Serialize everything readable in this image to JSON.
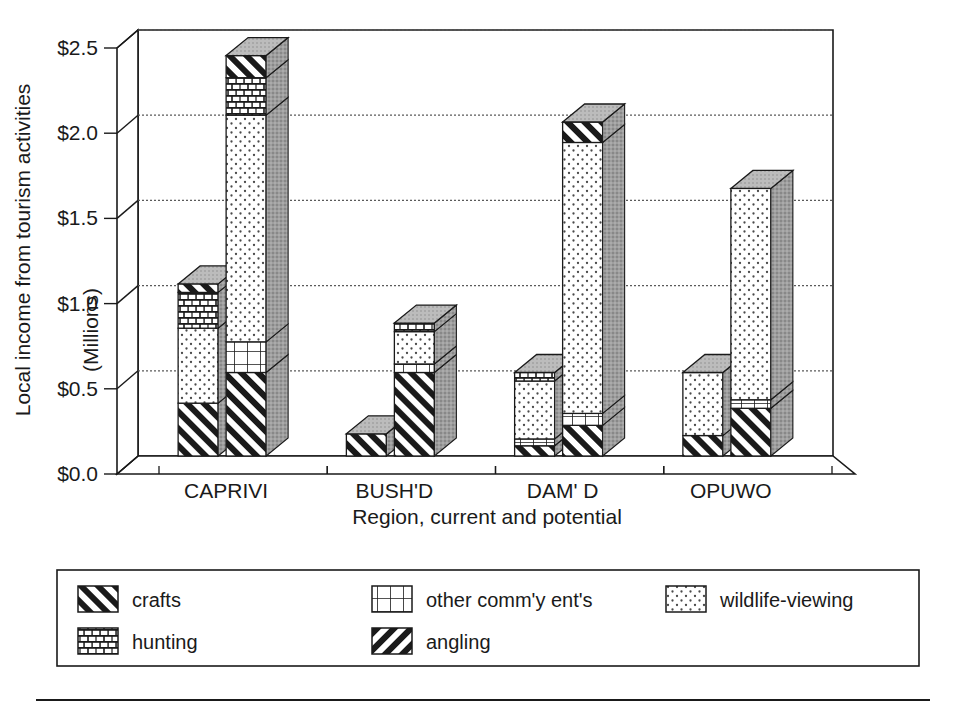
{
  "chart_data": {
    "type": "bar",
    "title": "",
    "subtitle": "",
    "xlabel": "Region, current and potential",
    "ylabel": "Local income from tourism activities",
    "ylabel2": "(Millions)",
    "ylim": [
      0.0,
      2.5
    ],
    "ytick_labels": [
      "$0.0",
      "$0.5",
      "$1.0",
      "$1.5",
      "$2.0",
      "$2.5"
    ],
    "ytick_values": [
      0.0,
      0.5,
      1.0,
      1.5,
      2.0,
      2.5
    ],
    "grid": true,
    "grid_style": "dotted horizontal",
    "stacked": true,
    "legend_position": "below-plot",
    "legend": [
      {
        "name": "crafts",
        "pattern": "diagonal-stripes-forward"
      },
      {
        "name": "hunting",
        "pattern": "brick"
      },
      {
        "name": "other comm'y ent's",
        "pattern": "grid"
      },
      {
        "name": "angling",
        "pattern": "diagonal-stripes-back"
      },
      {
        "name": "wildlife-viewing",
        "pattern": "dots"
      }
    ],
    "categories": [
      "CAPRIVI",
      "BUSH'D",
      "DAM' D",
      "OPUWO"
    ],
    "bars_per_category": [
      "current",
      "potential"
    ],
    "bars": [
      {
        "category": "CAPRIVI",
        "variant": "current",
        "total": 1.01,
        "segments": [
          {
            "series": "crafts",
            "value": 0.31
          },
          {
            "series": "wildlife-viewing",
            "value": 0.44
          },
          {
            "series": "hunting",
            "value": 0.21
          },
          {
            "series": "crafts",
            "value": 0.05
          }
        ]
      },
      {
        "category": "CAPRIVI",
        "variant": "potential",
        "total": 2.35,
        "segments": [
          {
            "series": "crafts",
            "value": 0.49
          },
          {
            "series": "other comm'y ent's",
            "value": 0.18
          },
          {
            "series": "wildlife-viewing",
            "value": 1.33
          },
          {
            "series": "hunting",
            "value": 0.22
          },
          {
            "series": "crafts",
            "value": 0.13
          }
        ]
      },
      {
        "category": "BUSH'D",
        "variant": "current",
        "total": 0.13,
        "segments": [
          {
            "series": "crafts",
            "value": 0.13
          }
        ]
      },
      {
        "category": "BUSH'D",
        "variant": "potential",
        "total": 0.78,
        "segments": [
          {
            "series": "crafts",
            "value": 0.49
          },
          {
            "series": "other comm'y ent's",
            "value": 0.05
          },
          {
            "series": "wildlife-viewing",
            "value": 0.19
          },
          {
            "series": "hunting",
            "value": 0.05
          }
        ]
      },
      {
        "category": "DAM' D",
        "variant": "current",
        "total": 0.49,
        "segments": [
          {
            "series": "crafts",
            "value": 0.06
          },
          {
            "series": "other comm'y ent's",
            "value": 0.04
          },
          {
            "series": "wildlife-viewing",
            "value": 0.34
          },
          {
            "series": "hunting",
            "value": 0.05
          }
        ]
      },
      {
        "category": "DAM' D",
        "variant": "potential",
        "total": 1.96,
        "segments": [
          {
            "series": "crafts",
            "value": 0.18
          },
          {
            "series": "other comm'y ent's",
            "value": 0.07
          },
          {
            "series": "wildlife-viewing",
            "value": 1.59
          },
          {
            "series": "crafts",
            "value": 0.12
          }
        ]
      },
      {
        "category": "OPUWO",
        "variant": "current",
        "total": 0.49,
        "segments": [
          {
            "series": "crafts",
            "value": 0.12
          },
          {
            "series": "wildlife-viewing",
            "value": 0.37
          }
        ]
      },
      {
        "category": "OPUWO",
        "variant": "potential",
        "total": 1.57,
        "segments": [
          {
            "series": "crafts",
            "value": 0.28
          },
          {
            "series": "other comm'y ent's",
            "value": 0.05
          },
          {
            "series": "wildlife-viewing",
            "value": 1.24
          }
        ]
      }
    ]
  },
  "axis": {
    "y_title": "Local income from tourism activities",
    "y_units": "(Millions)",
    "x_title": "Region, current and potential",
    "yticks": [
      "$0.0",
      "$0.5",
      "$1.0",
      "$1.5",
      "$2.0",
      "$2.5"
    ],
    "xticks": [
      "CAPRIVI",
      "BUSH'D",
      "DAM' D",
      "OPUWO"
    ]
  },
  "legend": {
    "items": [
      {
        "label": "crafts"
      },
      {
        "label": "hunting"
      },
      {
        "label": "other comm'y ent's"
      },
      {
        "label": "angling"
      },
      {
        "label": "wildlife-viewing"
      }
    ]
  },
  "colors": {
    "ink": "#1a1a1a",
    "paper": "#ffffff",
    "side_shade": "#9a9a9a",
    "top_shade": "#b8b8b8",
    "grid": "#6e6e6e"
  }
}
